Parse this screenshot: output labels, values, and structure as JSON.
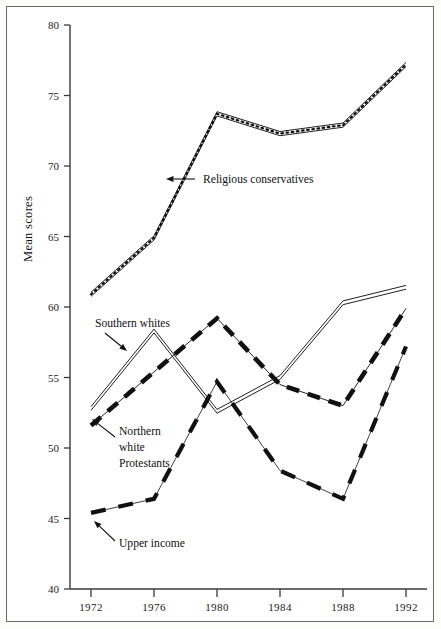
{
  "chart_data": {
    "type": "line",
    "title": "",
    "xlabel": "",
    "ylabel": "Mean scores",
    "x": [
      1972,
      1976,
      1980,
      1984,
      1988,
      1992
    ],
    "xtick_labels": [
      "1972",
      "1976",
      "1980",
      "1984",
      "1988",
      "1992"
    ],
    "ytick_labels": [
      "40",
      "45",
      "50",
      "55",
      "60",
      "65",
      "70",
      "75",
      "80"
    ],
    "yticks": [
      40,
      45,
      50,
      55,
      60,
      65,
      70,
      75,
      80
    ],
    "ylim": [
      40,
      80
    ],
    "xlim": [
      1972,
      1992
    ],
    "grid": false,
    "legend": "annotations-with-arrows",
    "series": [
      {
        "name": "Religious conservatives",
        "style": "beaded-double-line",
        "values": [
          60.9,
          64.9,
          73.7,
          72.3,
          72.9,
          77.2
        ]
      },
      {
        "name": "Southern whites",
        "style": "double-line",
        "values": [
          52.8,
          58.3,
          52.6,
          55.0,
          60.3,
          61.4
        ]
      },
      {
        "name": "Northern white Protestants",
        "style": "thick-dashed-line",
        "values": [
          51.6,
          55.4,
          59.2,
          54.5,
          53.0,
          59.9
        ]
      },
      {
        "name": "Upper income",
        "style": "thin-dashed-line",
        "values": [
          45.4,
          46.4,
          54.7,
          48.4,
          46.4,
          57.2
        ]
      }
    ],
    "annotations": [
      {
        "text": "Religious conservatives",
        "arrow": "left",
        "target_year": 1978
      },
      {
        "text": "Southern whites",
        "arrow": "down-right",
        "target_year": 1976
      },
      {
        "text": "Northern white Protestants",
        "lines": [
          "Northern",
          "white",
          "Protestants"
        ],
        "arrow": "up-left",
        "target_year": 1973
      },
      {
        "text": "Upper income",
        "arrow": "up-left",
        "target_year": 1972
      }
    ]
  },
  "axis": {
    "y_title": "Mean scores"
  }
}
